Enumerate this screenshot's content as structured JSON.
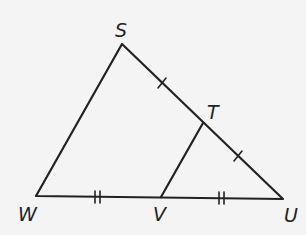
{
  "diagram": {
    "type": "triangle-midsegment",
    "colors": {
      "background": "#f4f4f4",
      "stroke": "#222222"
    },
    "vertices": [
      {
        "id": "S",
        "label": "S",
        "x": 122,
        "y": 44,
        "label_x": 121,
        "label_y": 37
      },
      {
        "id": "T",
        "label": "T",
        "x": 203,
        "y": 123,
        "label_x": 214,
        "label_y": 119
      },
      {
        "id": "W",
        "label": "W",
        "x": 36,
        "y": 196,
        "label_x": 29,
        "label_y": 220
      },
      {
        "id": "V",
        "label": "V",
        "x": 161,
        "y": 197,
        "label_x": 160,
        "label_y": 220
      },
      {
        "id": "U",
        "label": "U",
        "x": 283,
        "y": 199,
        "label_x": 291,
        "label_y": 221
      }
    ],
    "segments": [
      {
        "from": "S",
        "to": "W"
      },
      {
        "from": "S",
        "to": "U"
      },
      {
        "from": "W",
        "to": "U"
      },
      {
        "from": "T",
        "to": "V"
      }
    ],
    "tick_marks": [
      {
        "segment": "ST",
        "count": 1
      },
      {
        "segment": "TU",
        "count": 1
      },
      {
        "segment": "WV",
        "count": 2
      },
      {
        "segment": "VU",
        "count": 2
      }
    ]
  }
}
